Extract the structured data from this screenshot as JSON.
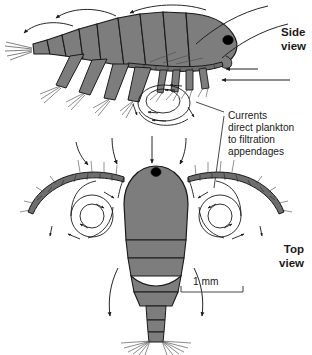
{
  "figure": {
    "background_color": "#ffffff",
    "body_fill": "#7d7d7d",
    "body_fill_dark": "#6e6e6e",
    "outline_color": "#1a1a1a",
    "flow_line_color": "#1a1a1a",
    "eye_color": "#000000"
  },
  "labels": {
    "side_view": "Side\nview",
    "top_view": "Top\nview",
    "currents_annotation": "Currents\ndirect plankton\nto filtration\nappendages"
  },
  "scale_bar": {
    "label": "1 mm",
    "length_px": 62,
    "x_start": 181,
    "x_end": 243,
    "y": 292,
    "tick_height": 6
  },
  "panels": [
    {
      "id": "side-view",
      "label": "Side view",
      "orientation": "lateral"
    },
    {
      "id": "top-view",
      "label": "Top view",
      "orientation": "dorsal"
    }
  ]
}
